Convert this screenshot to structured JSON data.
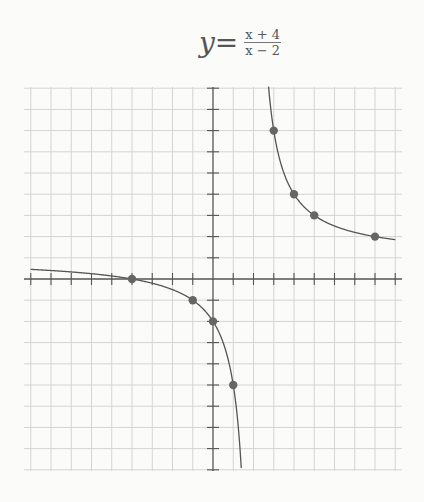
{
  "title": {
    "lhs": "y=",
    "numerator": "x + 4",
    "denominator": "x − 2"
  },
  "chart_data": {
    "type": "line",
    "function": "(x + 4) / (x - 2)",
    "xlabel": "",
    "ylabel": "",
    "xlim": [
      -9,
      9
    ],
    "ylim": [
      -9,
      9
    ],
    "grid": true,
    "tick_labels": false,
    "asymptotes": {
      "vertical": 2,
      "horizontal": 1
    },
    "series": [
      {
        "name": "y = (x+4)/(x-2)",
        "branches": [
          {
            "x_range": [
              -9,
              1.5
            ]
          },
          {
            "x_range": [
              2.68,
              9
            ]
          }
        ]
      }
    ],
    "points": [
      {
        "x": -4,
        "y": 0
      },
      {
        "x": -1,
        "y": -1
      },
      {
        "x": 0,
        "y": -2
      },
      {
        "x": 1,
        "y": -5
      },
      {
        "x": 3,
        "y": 7
      },
      {
        "x": 4,
        "y": 4
      },
      {
        "x": 5,
        "y": 3
      },
      {
        "x": 8,
        "y": 2
      }
    ],
    "colors": {
      "grid": "#d4d4d4",
      "axis": "#555555",
      "curve": "#555555",
      "point": "#666666"
    }
  }
}
